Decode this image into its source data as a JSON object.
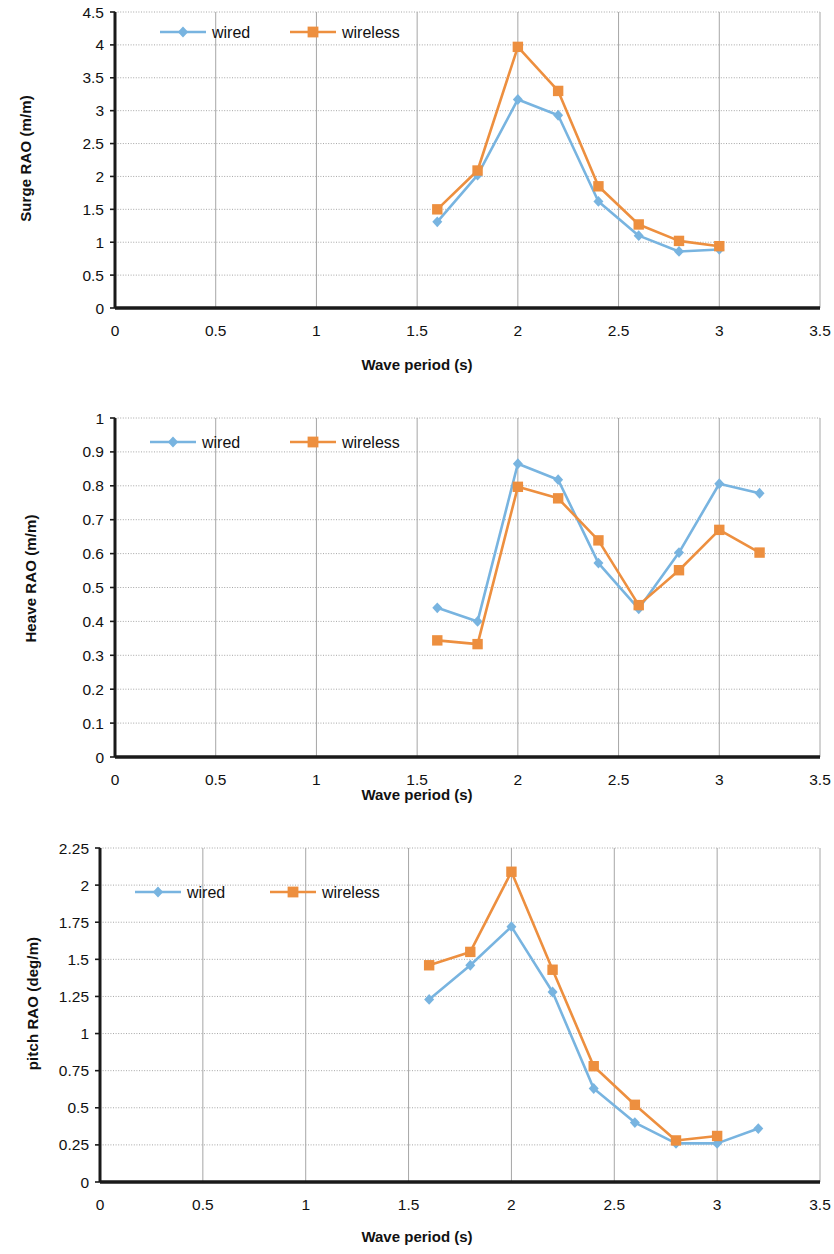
{
  "colors": {
    "wired": "#78B4E0",
    "wireless": "#ED8F3F",
    "axis": "#1a1a1a",
    "grid": "#a6a6a6",
    "text": "#111111"
  },
  "legend": {
    "wired_label": "wired",
    "wireless_label": "wireless"
  },
  "figures": [
    {
      "id": "surge",
      "ylabel": "Surge RAO (m/m)",
      "xlabel": "Wave period (s)"
    },
    {
      "id": "heave",
      "ylabel": "Heave RAO (m/m)",
      "xlabel": "Wave period (s)"
    },
    {
      "id": "pitch",
      "ylabel": "pitch RAO (deg/m)",
      "xlabel": "Wave period (s)"
    }
  ],
  "chart_data": [
    {
      "type": "line",
      "title": "",
      "xlabel": "Wave period (s)",
      "ylabel": "Surge RAO (m/m)",
      "xlim": [
        0,
        3.5
      ],
      "ylim": [
        0,
        4.5
      ],
      "xticks": [
        0,
        0.5,
        1,
        1.5,
        2,
        2.5,
        3,
        3.5
      ],
      "xticklabels": [
        "0",
        "0.5",
        "1",
        "1.5",
        "2",
        "2.5",
        "3",
        "3.5"
      ],
      "yticks": [
        0,
        0.5,
        1,
        1.5,
        2,
        2.5,
        3,
        3.5,
        4,
        4.5
      ],
      "yticklabels": [
        "0",
        "0.5",
        "1",
        "1.5",
        "2",
        "2.5",
        "3",
        "3.5",
        "4",
        "4.5"
      ],
      "grid": true,
      "legend_position": "top-left-inside",
      "series": [
        {
          "name": "wired",
          "marker": "diamond",
          "color": "#78B4E0",
          "x": [
            1.6,
            1.8,
            2.0,
            2.2,
            2.4,
            2.6,
            2.8,
            3.0
          ],
          "values": [
            1.31,
            2.02,
            3.17,
            2.93,
            1.62,
            1.1,
            0.86,
            0.89
          ]
        },
        {
          "name": "wireless",
          "marker": "square",
          "color": "#ED8F3F",
          "x": [
            1.6,
            1.8,
            2.0,
            2.2,
            2.4,
            2.6,
            2.8,
            3.0
          ],
          "values": [
            1.5,
            2.09,
            3.97,
            3.3,
            1.85,
            1.27,
            1.02,
            0.94
          ]
        }
      ]
    },
    {
      "type": "line",
      "title": "",
      "xlabel": "Wave period (s)",
      "ylabel": "Heave RAO (m/m)",
      "xlim": [
        0,
        3.5
      ],
      "ylim": [
        0,
        1
      ],
      "xticks": [
        0,
        0.5,
        1,
        1.5,
        2,
        2.5,
        3,
        3.5
      ],
      "xticklabels": [
        "0",
        "0.5",
        "1",
        "1.5",
        "2",
        "2.5",
        "3",
        "3.5"
      ],
      "yticks": [
        0,
        0.1,
        0.2,
        0.3,
        0.4,
        0.5,
        0.6,
        0.7,
        0.8,
        0.9,
        1
      ],
      "yticklabels": [
        "0",
        "0.1",
        "0.2",
        "0.3",
        "0.4",
        "0.5",
        "0.6",
        "0.7",
        "0.8",
        "0.9",
        "1"
      ],
      "grid": true,
      "legend_position": "top-left-inside",
      "series": [
        {
          "name": "wired",
          "marker": "diamond",
          "color": "#78B4E0",
          "x": [
            1.6,
            1.8,
            2.0,
            2.2,
            2.4,
            2.6,
            2.8,
            3.0,
            3.2
          ],
          "values": [
            0.44,
            0.4,
            0.865,
            0.818,
            0.572,
            0.437,
            0.603,
            0.806,
            0.778
          ]
        },
        {
          "name": "wireless",
          "marker": "square",
          "color": "#ED8F3F",
          "x": [
            1.6,
            1.8,
            2.0,
            2.2,
            2.4,
            2.6,
            2.8,
            3.0,
            3.2
          ],
          "values": [
            0.344,
            0.333,
            0.797,
            0.763,
            0.639,
            0.448,
            0.551,
            0.67,
            0.603
          ]
        }
      ]
    },
    {
      "type": "line",
      "title": "",
      "xlabel": "Wave period (s)",
      "ylabel": "pitch RAO (deg/m)",
      "xlim": [
        0,
        3.5
      ],
      "ylim": [
        0,
        2.25
      ],
      "xticks": [
        0,
        0.5,
        1,
        1.5,
        2,
        2.5,
        3,
        3.5
      ],
      "xticklabels": [
        "0",
        "0.5",
        "1",
        "1.5",
        "2",
        "2.5",
        "3",
        "3.5"
      ],
      "yticks": [
        0,
        0.25,
        0.5,
        0.75,
        1,
        1.25,
        1.5,
        1.75,
        2,
        2.25
      ],
      "yticklabels": [
        "0",
        "0.25",
        "0.5",
        "0.75",
        "1",
        "1.25",
        "1.5",
        "1.75",
        "2",
        "2.25"
      ],
      "grid": true,
      "legend_position": "top-left-inside",
      "series": [
        {
          "name": "wired",
          "marker": "diamond",
          "color": "#78B4E0",
          "x": [
            1.6,
            1.8,
            2.0,
            2.2,
            2.4,
            2.6,
            2.8,
            3.0,
            3.2
          ],
          "values": [
            1.23,
            1.46,
            1.72,
            1.28,
            0.63,
            0.4,
            0.26,
            0.26,
            0.36
          ]
        },
        {
          "name": "wireless",
          "marker": "square",
          "color": "#ED8F3F",
          "x": [
            1.6,
            1.8,
            2.0,
            2.2,
            2.4,
            2.6,
            2.8,
            3.0
          ],
          "values": [
            1.46,
            1.55,
            2.09,
            1.43,
            0.78,
            0.52,
            0.28,
            0.31
          ]
        }
      ]
    }
  ]
}
